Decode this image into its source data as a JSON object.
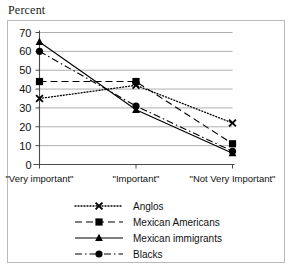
{
  "axis_title": "Percent",
  "chart_data": {
    "type": "line",
    "title": "",
    "subtitle": "",
    "xlabel": "",
    "ylabel": "Percent",
    "categories": [
      "\"Very important\"",
      "\"Important\"",
      "\"Not Very Important\""
    ],
    "ylim": [
      0,
      70
    ],
    "yticks": [
      0,
      10,
      20,
      30,
      40,
      50,
      60,
      70
    ],
    "ytick_labels": [
      "0",
      "10",
      "20",
      "30",
      "40",
      "50",
      "60",
      "70"
    ],
    "grid": true,
    "grid_axis": "y",
    "legend_position": "bottom",
    "series": [
      {
        "name": "Anglos",
        "values": [
          35,
          42,
          22
        ],
        "marker": "x-marker",
        "line_style": "dotted",
        "color": "#000000"
      },
      {
        "name": "Mexican Americans",
        "values": [
          44,
          44,
          11
        ],
        "marker": "square-marker",
        "line_style": "dashed",
        "color": "#000000"
      },
      {
        "name": "Mexican immigrants",
        "values": [
          65,
          29,
          6
        ],
        "marker": "triangle-marker",
        "line_style": "solid",
        "color": "#000000"
      },
      {
        "name": "Blacks",
        "values": [
          60,
          31,
          7
        ],
        "marker": "circle-marker",
        "line_style": "dash-dot",
        "color": "#000000"
      }
    ]
  },
  "legend": {
    "items": [
      {
        "label": "Anglos",
        "marker": "x-marker",
        "line_style": "dotted"
      },
      {
        "label": "Mexican Americans",
        "marker": "square-marker",
        "line_style": "dashed"
      },
      {
        "label": "Mexican immigrants",
        "marker": "triangle-marker",
        "line_style": "solid"
      },
      {
        "label": "Blacks",
        "marker": "circle-marker",
        "line_style": "dash-dot"
      }
    ]
  },
  "colors": {
    "ink": "#000000",
    "grid": "#9a9a9a",
    "frame": "#b9b9b9",
    "axis": "#555555"
  }
}
